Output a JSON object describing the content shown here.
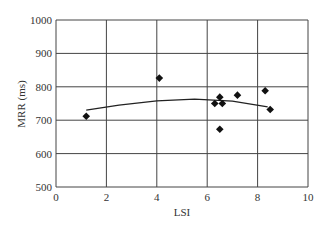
{
  "chart_data": {
    "type": "scatter",
    "title": "",
    "xlabel": "LSI",
    "ylabel": "MRR (ms)",
    "xlim": [
      0,
      10
    ],
    "ylim": [
      500,
      1000
    ],
    "xticks": [
      0,
      2,
      4,
      6,
      8,
      10
    ],
    "yticks": [
      500,
      600,
      700,
      800,
      900,
      1000
    ],
    "grid": true,
    "legend": null,
    "series": [
      {
        "name": "data",
        "marker": "diamond",
        "points": [
          {
            "x": 1.2,
            "y": 712
          },
          {
            "x": 4.1,
            "y": 826
          },
          {
            "x": 6.3,
            "y": 750
          },
          {
            "x": 6.5,
            "y": 769
          },
          {
            "x": 6.6,
            "y": 750
          },
          {
            "x": 6.5,
            "y": 673
          },
          {
            "x": 7.2,
            "y": 775
          },
          {
            "x": 8.3,
            "y": 788
          },
          {
            "x": 8.5,
            "y": 732
          }
        ]
      },
      {
        "name": "trend",
        "type": "line",
        "points": [
          {
            "x": 1.2,
            "y": 730
          },
          {
            "x": 2.5,
            "y": 745
          },
          {
            "x": 4.0,
            "y": 758
          },
          {
            "x": 5.5,
            "y": 763
          },
          {
            "x": 7.0,
            "y": 757
          },
          {
            "x": 8.4,
            "y": 740
          }
        ]
      }
    ]
  }
}
